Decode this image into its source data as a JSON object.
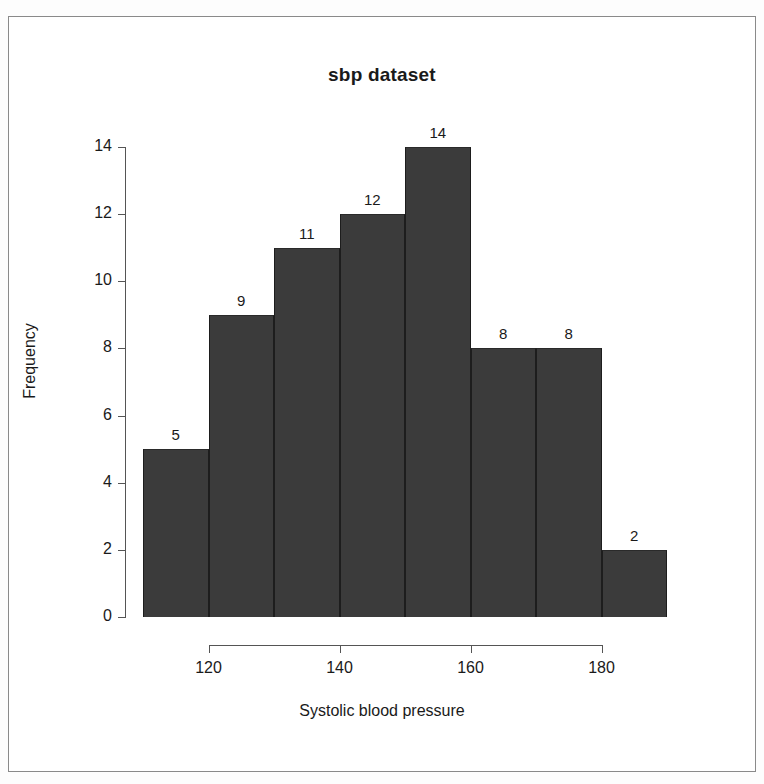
{
  "chart_data": {
    "type": "bar",
    "title": "sbp dataset",
    "xlabel": "Systolic blood pressure",
    "ylabel": "Frequency",
    "categories": [
      "110-120",
      "120-130",
      "130-140",
      "140-150",
      "150-160",
      "160-170",
      "170-180",
      "180-190"
    ],
    "bin_edges": [
      110,
      120,
      130,
      140,
      150,
      160,
      170,
      180,
      190
    ],
    "values": [
      5,
      9,
      11,
      12,
      14,
      8,
      8,
      2
    ],
    "bar_labels": [
      "5",
      "9",
      "11",
      "12",
      "14",
      "8",
      "8",
      "2"
    ],
    "xlim": [
      110,
      190
    ],
    "ylim": [
      0,
      14
    ],
    "xticks": [
      120,
      140,
      160,
      180
    ],
    "xtick_labels": [
      "120",
      "140",
      "160",
      "180"
    ],
    "yticks": [
      0,
      2,
      4,
      6,
      8,
      10,
      12,
      14
    ],
    "ytick_labels": [
      "0",
      "2",
      "4",
      "6",
      "8",
      "10",
      "12",
      "14"
    ],
    "grid": false,
    "legend": null,
    "bar_color": "#3b3b3b",
    "bar_border_color": "#1d1d1d",
    "axis_color": "#555555",
    "background": "#ffffff"
  }
}
